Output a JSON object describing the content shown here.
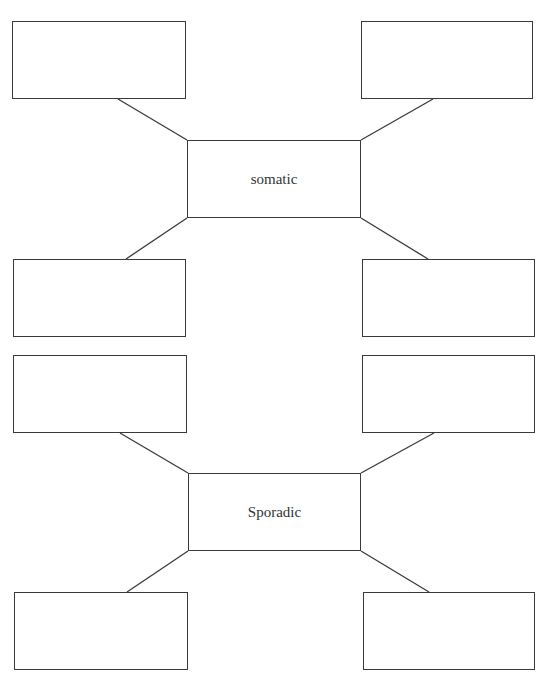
{
  "diagram": {
    "type": "spider-map",
    "groups": [
      {
        "center": {
          "label": "somatic",
          "x": 187,
          "y": 140,
          "w": 174,
          "h": 78
        },
        "leaves": [
          {
            "position": "top-left",
            "label": "",
            "x": 12,
            "y": 21,
            "w": 174,
            "h": 78,
            "anchor": [
              118,
              99
            ]
          },
          {
            "position": "top-right",
            "label": "",
            "x": 361,
            "y": 21,
            "w": 172,
            "h": 78,
            "anchor": [
              433,
              99
            ]
          },
          {
            "position": "bottom-left",
            "label": "",
            "x": 13,
            "y": 259,
            "w": 173,
            "h": 78,
            "anchor": [
              126,
              259
            ]
          },
          {
            "position": "bottom-right",
            "label": "",
            "x": 362,
            "y": 259,
            "w": 173,
            "h": 78,
            "anchor": [
              428,
              259
            ]
          }
        ]
      },
      {
        "center": {
          "label": "Sporadic",
          "x": 188,
          "y": 473,
          "w": 173,
          "h": 78
        },
        "leaves": [
          {
            "position": "top-left",
            "label": "",
            "x": 13,
            "y": 355,
            "w": 174,
            "h": 78,
            "anchor": [
              120,
              433
            ]
          },
          {
            "position": "top-right",
            "label": "",
            "x": 362,
            "y": 355,
            "w": 173,
            "h": 78,
            "anchor": [
              434,
              433
            ]
          },
          {
            "position": "bottom-left",
            "label": "",
            "x": 14,
            "y": 592,
            "w": 174,
            "h": 78,
            "anchor": [
              127,
              592
            ]
          },
          {
            "position": "bottom-right",
            "label": "",
            "x": 363,
            "y": 592,
            "w": 172,
            "h": 78,
            "anchor": [
              429,
              592
            ]
          }
        ]
      }
    ],
    "colors": {
      "stroke": "#3a3a3a",
      "text": "#333333",
      "background": "#ffffff"
    }
  }
}
